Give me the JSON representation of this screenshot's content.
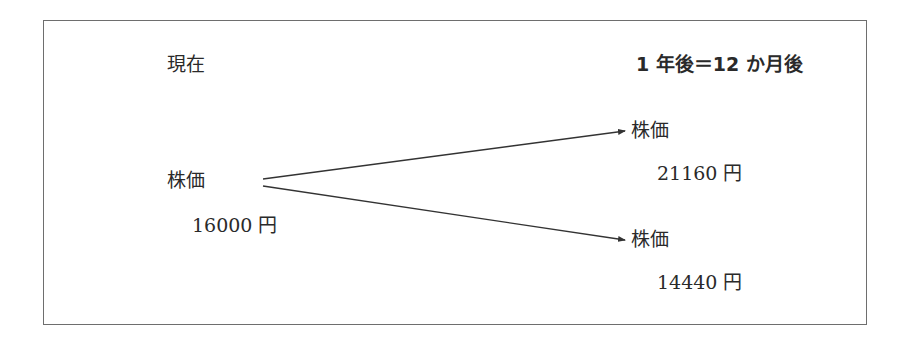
{
  "diagram": {
    "type": "binomial-tree",
    "headings": {
      "now": "現在",
      "later": "1 年後＝12 か月後"
    },
    "nodes": {
      "start": {
        "title": "株価",
        "value": "16000 円"
      },
      "up": {
        "title": "株価",
        "value": "21160 円"
      },
      "down": {
        "title": "株価",
        "value": "14440 円"
      }
    },
    "edges": [
      {
        "from": "start",
        "to": "up"
      },
      {
        "from": "start",
        "to": "down"
      }
    ],
    "colors": {
      "line": "#333333",
      "border": "#6e6e6e",
      "text": "#2a2a2a"
    }
  }
}
